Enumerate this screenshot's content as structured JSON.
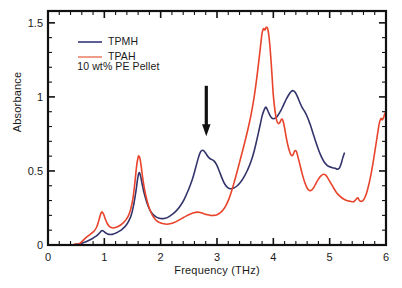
{
  "chart_data": {
    "type": "line",
    "title": "",
    "xlabel": "Frequency (THz)",
    "ylabel": "Absorbance",
    "xlim": [
      0,
      6
    ],
    "ylim": [
      0,
      1.58
    ],
    "xticks": [
      0,
      1,
      2,
      3,
      4,
      5,
      6
    ],
    "xtick_labels": [
      "0",
      "1",
      "2",
      "3",
      "4",
      "5",
      "6"
    ],
    "x_minor_step": 0.2,
    "yticks": [
      0,
      0.5,
      1,
      1.5
    ],
    "ytick_labels": [
      "0",
      "0.5",
      "1",
      "1.5"
    ],
    "y_minor_step": 0.1,
    "grid": false,
    "frame": "box",
    "tick_direction": "in",
    "legend_position": "upper-left",
    "annotations": [
      {
        "name": "downward-arrow",
        "type": "arrow",
        "x": 2.81,
        "y_tail": 1.075,
        "y_head": 0.735,
        "color": "#111111"
      }
    ],
    "extra_text": [
      {
        "name": "sample-note",
        "text": "10 wt% PE Pellet",
        "x": 0.52,
        "y": 1.205
      }
    ],
    "series": [
      {
        "name": "TPMH",
        "label": "TPMH",
        "color": "#33346b",
        "legend_color": "#5b5f96",
        "width": 1.6,
        "points": [
          [
            0.5,
            0.005
          ],
          [
            0.58,
            0.01
          ],
          [
            0.66,
            0.02
          ],
          [
            0.72,
            0.03
          ],
          [
            0.78,
            0.042
          ],
          [
            0.84,
            0.056
          ],
          [
            0.89,
            0.072
          ],
          [
            0.93,
            0.088
          ],
          [
            0.96,
            0.098
          ],
          [
            0.99,
            0.092
          ],
          [
            1.03,
            0.08
          ],
          [
            1.08,
            0.072
          ],
          [
            1.14,
            0.072
          ],
          [
            1.2,
            0.08
          ],
          [
            1.26,
            0.092
          ],
          [
            1.32,
            0.108
          ],
          [
            1.38,
            0.13
          ],
          [
            1.43,
            0.16
          ],
          [
            1.48,
            0.205
          ],
          [
            1.52,
            0.27
          ],
          [
            1.56,
            0.36
          ],
          [
            1.59,
            0.445
          ],
          [
            1.615,
            0.487
          ],
          [
            1.64,
            0.47
          ],
          [
            1.67,
            0.415
          ],
          [
            1.71,
            0.345
          ],
          [
            1.76,
            0.28
          ],
          [
            1.81,
            0.235
          ],
          [
            1.86,
            0.208
          ],
          [
            1.91,
            0.192
          ],
          [
            1.96,
            0.183
          ],
          [
            2.02,
            0.178
          ],
          [
            2.08,
            0.18
          ],
          [
            2.14,
            0.19
          ],
          [
            2.21,
            0.208
          ],
          [
            2.28,
            0.232
          ],
          [
            2.35,
            0.265
          ],
          [
            2.42,
            0.31
          ],
          [
            2.49,
            0.37
          ],
          [
            2.56,
            0.44
          ],
          [
            2.62,
            0.52
          ],
          [
            2.67,
            0.59
          ],
          [
            2.71,
            0.63
          ],
          [
            2.745,
            0.64
          ],
          [
            2.78,
            0.63
          ],
          [
            2.82,
            0.608
          ],
          [
            2.86,
            0.588
          ],
          [
            2.9,
            0.578
          ],
          [
            2.94,
            0.57
          ],
          [
            2.99,
            0.545
          ],
          [
            3.04,
            0.5
          ],
          [
            3.09,
            0.45
          ],
          [
            3.14,
            0.41
          ],
          [
            3.19,
            0.388
          ],
          [
            3.24,
            0.38
          ],
          [
            3.3,
            0.385
          ],
          [
            3.36,
            0.4
          ],
          [
            3.42,
            0.425
          ],
          [
            3.48,
            0.46
          ],
          [
            3.54,
            0.505
          ],
          [
            3.6,
            0.56
          ],
          [
            3.66,
            0.635
          ],
          [
            3.71,
            0.715
          ],
          [
            3.76,
            0.8
          ],
          [
            3.8,
            0.87
          ],
          [
            3.835,
            0.91
          ],
          [
            3.86,
            0.93
          ],
          [
            3.88,
            0.925
          ],
          [
            3.91,
            0.9
          ],
          [
            3.94,
            0.875
          ],
          [
            3.97,
            0.858
          ],
          [
            4.0,
            0.852
          ],
          [
            4.04,
            0.858
          ],
          [
            4.08,
            0.875
          ],
          [
            4.13,
            0.905
          ],
          [
            4.18,
            0.945
          ],
          [
            4.23,
            0.985
          ],
          [
            4.28,
            1.018
          ],
          [
            4.32,
            1.038
          ],
          [
            4.355,
            1.042
          ],
          [
            4.39,
            1.03
          ],
          [
            4.43,
            1.0
          ],
          [
            4.47,
            0.962
          ],
          [
            4.51,
            0.93
          ],
          [
            4.55,
            0.905
          ],
          [
            4.6,
            0.868
          ],
          [
            4.65,
            0.818
          ],
          [
            4.7,
            0.76
          ],
          [
            4.75,
            0.7
          ],
          [
            4.8,
            0.645
          ],
          [
            4.85,
            0.598
          ],
          [
            4.9,
            0.562
          ],
          [
            4.95,
            0.54
          ],
          [
            5.0,
            0.528
          ],
          [
            5.05,
            0.522
          ],
          [
            5.1,
            0.518
          ],
          [
            5.13,
            0.512
          ],
          [
            5.17,
            0.518
          ],
          [
            5.2,
            0.545
          ],
          [
            5.23,
            0.585
          ],
          [
            5.26,
            0.62
          ]
        ]
      },
      {
        "name": "TPAH",
        "label": "TPAH",
        "color": "#e8432b",
        "legend_color": "#ef9c89",
        "width": 1.6,
        "points": [
          [
            0.48,
            0.008
          ],
          [
            0.53,
            0.004
          ],
          [
            0.57,
            0.012
          ],
          [
            0.62,
            0.03
          ],
          [
            0.67,
            0.048
          ],
          [
            0.72,
            0.063
          ],
          [
            0.77,
            0.078
          ],
          [
            0.82,
            0.095
          ],
          [
            0.86,
            0.118
          ],
          [
            0.89,
            0.15
          ],
          [
            0.92,
            0.19
          ],
          [
            0.945,
            0.218
          ],
          [
            0.965,
            0.222
          ],
          [
            0.99,
            0.205
          ],
          [
            1.02,
            0.172
          ],
          [
            1.06,
            0.14
          ],
          [
            1.1,
            0.122
          ],
          [
            1.15,
            0.115
          ],
          [
            1.2,
            0.118
          ],
          [
            1.26,
            0.128
          ],
          [
            1.32,
            0.145
          ],
          [
            1.38,
            0.168
          ],
          [
            1.43,
            0.2
          ],
          [
            1.47,
            0.245
          ],
          [
            1.51,
            0.32
          ],
          [
            1.545,
            0.43
          ],
          [
            1.575,
            0.54
          ],
          [
            1.6,
            0.592
          ],
          [
            1.615,
            0.6
          ],
          [
            1.635,
            0.58
          ],
          [
            1.66,
            0.515
          ],
          [
            1.69,
            0.43
          ],
          [
            1.73,
            0.345
          ],
          [
            1.78,
            0.27
          ],
          [
            1.83,
            0.218
          ],
          [
            1.88,
            0.185
          ],
          [
            1.93,
            0.163
          ],
          [
            1.99,
            0.15
          ],
          [
            2.05,
            0.143
          ],
          [
            2.11,
            0.14
          ],
          [
            2.17,
            0.143
          ],
          [
            2.24,
            0.152
          ],
          [
            2.31,
            0.165
          ],
          [
            2.38,
            0.18
          ],
          [
            2.45,
            0.195
          ],
          [
            2.52,
            0.208
          ],
          [
            2.59,
            0.218
          ],
          [
            2.65,
            0.222
          ],
          [
            2.7,
            0.22
          ],
          [
            2.76,
            0.212
          ],
          [
            2.82,
            0.205
          ],
          [
            2.88,
            0.2
          ],
          [
            2.94,
            0.2
          ],
          [
            3.0,
            0.205
          ],
          [
            3.06,
            0.218
          ],
          [
            3.11,
            0.238
          ],
          [
            3.16,
            0.268
          ],
          [
            3.21,
            0.31
          ],
          [
            3.26,
            0.365
          ],
          [
            3.31,
            0.43
          ],
          [
            3.36,
            0.5
          ],
          [
            3.41,
            0.572
          ],
          [
            3.46,
            0.645
          ],
          [
            3.51,
            0.72
          ],
          [
            3.56,
            0.8
          ],
          [
            3.61,
            0.89
          ],
          [
            3.66,
            1.0
          ],
          [
            3.7,
            1.11
          ],
          [
            3.74,
            1.235
          ],
          [
            3.775,
            1.35
          ],
          [
            3.8,
            1.43
          ],
          [
            3.825,
            1.46
          ],
          [
            3.85,
            1.452
          ],
          [
            3.875,
            1.47
          ],
          [
            3.9,
            1.46
          ],
          [
            3.92,
            1.415
          ],
          [
            3.94,
            1.34
          ],
          [
            3.96,
            1.24
          ],
          [
            3.98,
            1.125
          ],
          [
            4.0,
            1.01
          ],
          [
            4.03,
            0.905
          ],
          [
            4.06,
            0.84
          ],
          [
            4.09,
            0.82
          ],
          [
            4.12,
            0.83
          ],
          [
            4.145,
            0.85
          ],
          [
            4.17,
            0.84
          ],
          [
            4.2,
            0.79
          ],
          [
            4.23,
            0.725
          ],
          [
            4.26,
            0.67
          ],
          [
            4.29,
            0.63
          ],
          [
            4.32,
            0.605
          ],
          [
            4.35,
            0.61
          ],
          [
            4.38,
            0.635
          ],
          [
            4.41,
            0.63
          ],
          [
            4.44,
            0.59
          ],
          [
            4.48,
            0.53
          ],
          [
            4.52,
            0.47
          ],
          [
            4.56,
            0.42
          ],
          [
            4.6,
            0.385
          ],
          [
            4.64,
            0.368
          ],
          [
            4.68,
            0.37
          ],
          [
            4.72,
            0.39
          ],
          [
            4.76,
            0.418
          ],
          [
            4.8,
            0.445
          ],
          [
            4.85,
            0.468
          ],
          [
            4.89,
            0.478
          ],
          [
            4.93,
            0.472
          ],
          [
            4.97,
            0.45
          ],
          [
            5.02,
            0.418
          ],
          [
            5.07,
            0.385
          ],
          [
            5.12,
            0.355
          ],
          [
            5.18,
            0.33
          ],
          [
            5.24,
            0.312
          ],
          [
            5.3,
            0.3
          ],
          [
            5.36,
            0.295
          ],
          [
            5.42,
            0.292
          ],
          [
            5.46,
            0.305
          ],
          [
            5.5,
            0.318
          ],
          [
            5.53,
            0.3
          ],
          [
            5.57,
            0.295
          ],
          [
            5.61,
            0.31
          ],
          [
            5.65,
            0.345
          ],
          [
            5.69,
            0.4
          ],
          [
            5.73,
            0.47
          ],
          [
            5.77,
            0.555
          ],
          [
            5.81,
            0.65
          ],
          [
            5.85,
            0.75
          ],
          [
            5.88,
            0.82
          ],
          [
            5.91,
            0.855
          ],
          [
            5.93,
            0.845
          ],
          [
            5.955,
            0.858
          ],
          [
            5.98,
            0.888
          ],
          [
            6.0,
            0.9
          ]
        ]
      }
    ]
  },
  "legend": {
    "items": [
      {
        "label": "TPMH",
        "color": "#5b5f96"
      },
      {
        "label": "TPAH",
        "color": "#ef9c89"
      }
    ],
    "note": "10 wt% PE Pellet"
  },
  "axes": {
    "xlabel": "Frequency (THz)",
    "ylabel": "Absorbance"
  }
}
